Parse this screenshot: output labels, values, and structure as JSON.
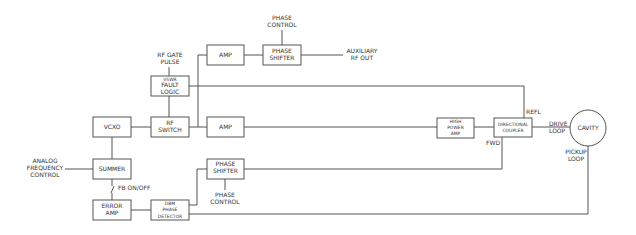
{
  "diagram": {
    "blocks": {
      "amp_top": "AMP",
      "phase_shifter_top": [
        "PHASE",
        "SHIFTER"
      ],
      "vswr_fault_logic": [
        "VSWR",
        "FAULT",
        "LOGIC"
      ],
      "vcxo": "VCXO",
      "rf_switch": [
        "RF",
        "SWITCH"
      ],
      "amp_mid": "AMP",
      "high_power_amp": [
        "HIGH",
        "POWER",
        "AMP"
      ],
      "directional_coupler": [
        "DIRECTIONAL",
        "COUPLER"
      ],
      "cavity": "CAVITY",
      "summer": "SUMMER",
      "phase_shifter_bottom": [
        "PHASE",
        "SHIFTER"
      ],
      "error_amp": [
        "ERROR",
        "AMP"
      ],
      "dbm_phase_detector": [
        "DBM",
        "PHASE",
        "DETECTOR"
      ]
    },
    "labels": {
      "phase_control_top": [
        "PHASE",
        "CONTROL"
      ],
      "auxiliary_rf_out": [
        "AUXILIARY",
        "RF OUT"
      ],
      "rf_gate_pulse": [
        "RF GATE",
        "PULSE"
      ],
      "refl": "REFL",
      "fwd": "FWD",
      "drive_loop": [
        "DRIVE",
        "LOOP"
      ],
      "pickup_loop": [
        "PICKUP",
        "LOOP"
      ],
      "analog_frequency_control": [
        "ANALOG",
        "FREQUENCY",
        "CONTROL"
      ],
      "fb_on_off": "FB ON/OFF",
      "phase_control_bottom": [
        "PHASE",
        "CONTROL"
      ]
    }
  }
}
